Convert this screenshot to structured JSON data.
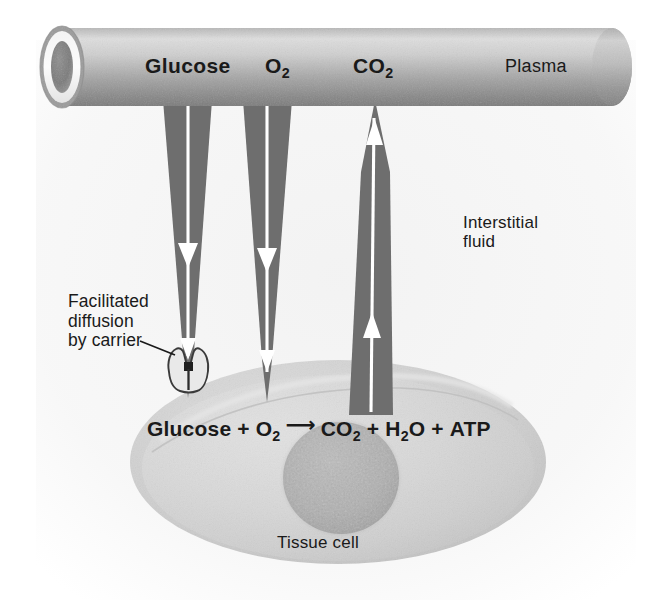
{
  "figure": {
    "kind": "biology-diagram",
    "background_color": "#ffffff"
  },
  "labels": {
    "glucose": "Glucose",
    "oxygen": "O",
    "oxygen_sub": "2",
    "carbon_dioxide": "CO",
    "carbon_dioxide_sub": "2",
    "plasma": "Plasma",
    "interstitial_fluid": "Interstitial\nfluid",
    "facilitated_diffusion": "Facilitated\ndiffusion\nby carrier",
    "tissue_cell": "Tissue cell"
  },
  "equation": {
    "reactant_1": "Glucose",
    "plus_1": "+",
    "reactant_2": "O",
    "reactant_2_sub": "2",
    "arrow": "⟶",
    "product_1": "CO",
    "product_1_sub": "2",
    "plus_2": "+",
    "product_2": "H",
    "product_2_sub": "2",
    "product_2_tail": "O",
    "plus_3": "+",
    "product_3": "ATP",
    "full_text": "Glucose + O2 ⟶ CO2 + H2O + ATP"
  },
  "arrows": [
    {
      "name": "glucose-arrow",
      "substance": "Glucose",
      "direction": "down",
      "from": "plasma",
      "to": "tissue cell",
      "transport": "facilitated diffusion by carrier"
    },
    {
      "name": "oxygen-arrow",
      "substance": "O2",
      "direction": "down",
      "from": "plasma",
      "to": "tissue cell",
      "transport": "simple diffusion"
    },
    {
      "name": "carbon-dioxide-arrow",
      "substance": "CO2",
      "direction": "up",
      "from": "tissue cell",
      "to": "plasma",
      "transport": "simple diffusion"
    }
  ],
  "structures": {
    "capillary": "capillary-vessel",
    "carrier_protein": "carrier-protein",
    "cell_body": "tissue-cell-body",
    "nucleus": "cell-nucleus"
  },
  "colors": {
    "arrow_gray": "#6e6e6e",
    "vessel_light": "#d8d8d8",
    "vessel_mid": "#aaaaaa",
    "vessel_dark": "#6f6f6f",
    "cell_fill": "#d6d6d6",
    "cell_rim": "#c6c6c6",
    "nucleus": "#aeaeae",
    "text": "#1a1a1a",
    "arrow_white": "#ffffff",
    "background": "#ffffff"
  }
}
